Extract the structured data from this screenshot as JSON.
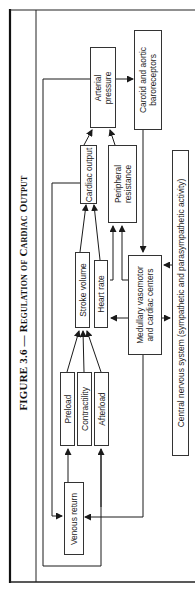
{
  "figure": {
    "title_prefix": "FIGURE 3.6 — ",
    "title_main": "Regulation of Cardiac Output",
    "orientation": "rotated 90° counter-clockwise"
  },
  "nodes": {
    "arterial_pressure": "Arterial\npressure",
    "baroreceptors": "Carotid and aortic\nbaroreceptors",
    "cardiac_output": "Cardiac output",
    "peripheral_resistance": "Peripheral\nresistance",
    "stroke_volume": "Stroke volume",
    "heart_rate": "Heart rate",
    "medullary_centers": "Medullary vasomotor\nand cardiac centers",
    "preload": "Preload",
    "contractility": "Contractility",
    "afterload": "Afterload",
    "venous_return": "Venous return",
    "cns": "Central nervous system (sympathetic and parasympathetic activity)"
  },
  "edges": [
    {
      "from": "Arterial pressure",
      "to": "Carotid and aortic baroreceptors"
    },
    {
      "from": "Carotid and aortic baroreceptors",
      "to": "Medullary vasomotor and cardiac centers"
    },
    {
      "from": "Cardiac output",
      "to": "Arterial pressure"
    },
    {
      "from": "Peripheral resistance",
      "to": "Arterial pressure"
    },
    {
      "from": "Stroke volume",
      "to": "Cardiac output"
    },
    {
      "from": "Heart rate",
      "to": "Cardiac output"
    },
    {
      "from": "Medullary vasomotor and cardiac centers",
      "to": "Peripheral resistance"
    },
    {
      "from": "Medullary vasomotor and cardiac centers",
      "to": "Heart rate"
    },
    {
      "from": "Medullary vasomotor and cardiac centers",
      "to": "Stroke volume"
    },
    {
      "from": "Medullary vasomotor and cardiac centers",
      "to": "Central nervous system"
    },
    {
      "from": "Central nervous system",
      "to": "Medullary vasomotor and cardiac centers"
    },
    {
      "from": "Preload",
      "to": "Stroke volume"
    },
    {
      "from": "Contractility",
      "to": "Stroke volume"
    },
    {
      "from": "Afterload",
      "to": "Stroke volume"
    },
    {
      "from": "Venous return",
      "to": "Preload"
    },
    {
      "from": "Medullary vasomotor and cardiac centers",
      "to": "Venous return"
    },
    {
      "from": "Cardiac output",
      "to": "Venous return"
    },
    {
      "from": "Arterial pressure",
      "to": "Afterload"
    }
  ],
  "colors": {
    "line": "#1a1a1a",
    "box_border": "#333333",
    "background": "#ffffff"
  }
}
